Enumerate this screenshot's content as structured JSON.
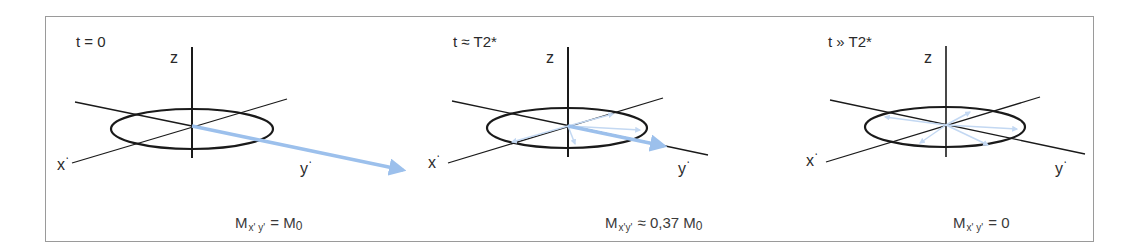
{
  "figure": {
    "arrow_color": "#9cc0ec",
    "axis_color": "#1a1a1a",
    "frame_color": "#9a9a9a"
  },
  "panels": [
    {
      "time_label": "t = 0",
      "axes": {
        "z": "z",
        "x": "x",
        "y": "y",
        "prime": "‘"
      },
      "formula": {
        "M": "M",
        "sub": "x' y'",
        "rel": "=",
        "value": "M",
        "value_sub": "0",
        "coef": ""
      },
      "vector_state": "single full-length vector along y'"
    },
    {
      "time_label": "t ≈ T2*",
      "axes": {
        "z": "z",
        "x": "x",
        "y": "y",
        "prime": "‘"
      },
      "formula": {
        "M": "M",
        "sub": "x'y'",
        "rel": "≈",
        "coef": "0,37",
        "value": "M",
        "value_sub": "0"
      },
      "vector_state": "partially dephased spins, shorter net vector"
    },
    {
      "time_label": "t » T2*",
      "axes": {
        "z": "z",
        "x": "x",
        "y": "y",
        "prime": "‘"
      },
      "formula": {
        "M": "M",
        "sub": "x' y'",
        "rel": "=",
        "value": "0",
        "value_sub": "",
        "coef": ""
      },
      "vector_state": "fully dephased spins, zero net vector"
    }
  ]
}
